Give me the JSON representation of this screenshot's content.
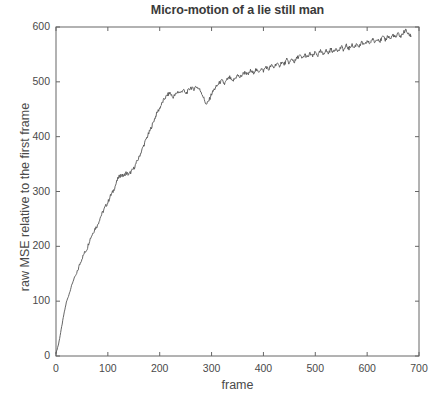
{
  "chart_data": {
    "type": "line",
    "title": "Micro-motion of a lie still man",
    "xlabel": "frame",
    "ylabel": "raw MSE relative to the first frame",
    "xlim": [
      0,
      700
    ],
    "ylim": [
      0,
      600
    ],
    "xticks": [
      0,
      100,
      200,
      300,
      400,
      500,
      600,
      700
    ],
    "yticks": [
      0,
      100,
      200,
      300,
      400,
      500,
      600
    ],
    "grid": false,
    "legend": null,
    "line_color": "#555555",
    "background_color": "#ffffff",
    "axes_color": "#666666",
    "series": [
      {
        "name": "raw MSE",
        "x": [
          0,
          5,
          10,
          15,
          20,
          25,
          30,
          35,
          40,
          45,
          50,
          55,
          60,
          65,
          70,
          75,
          80,
          85,
          90,
          95,
          100,
          105,
          110,
          115,
          120,
          125,
          130,
          135,
          140,
          145,
          150,
          155,
          160,
          165,
          170,
          175,
          180,
          185,
          190,
          195,
          200,
          205,
          210,
          215,
          220,
          225,
          230,
          235,
          240,
          245,
          250,
          255,
          260,
          265,
          270,
          275,
          280,
          285,
          290,
          295,
          300,
          305,
          310,
          315,
          320,
          325,
          330,
          335,
          340,
          345,
          350,
          355,
          360,
          365,
          370,
          375,
          380,
          385,
          390,
          395,
          400,
          405,
          410,
          415,
          420,
          425,
          430,
          435,
          440,
          445,
          450,
          455,
          460,
          465,
          470,
          475,
          480,
          485,
          490,
          495,
          500,
          505,
          510,
          515,
          520,
          525,
          530,
          535,
          540,
          545,
          550,
          555,
          560,
          565,
          570,
          575,
          580,
          585,
          590,
          595,
          600,
          605,
          610,
          615,
          620,
          625,
          630,
          635,
          640,
          645,
          650,
          655,
          660,
          665,
          670,
          675,
          680,
          685
        ],
        "y": [
          5,
          22,
          48,
          75,
          98,
          112,
          128,
          142,
          150,
          165,
          178,
          188,
          196,
          212,
          222,
          232,
          238,
          252,
          262,
          272,
          280,
          292,
          300,
          312,
          325,
          330,
          328,
          334,
          331,
          336,
          342,
          352,
          362,
          374,
          386,
          398,
          408,
          420,
          432,
          444,
          452,
          462,
          470,
          476,
          480,
          472,
          476,
          482,
          480,
          486,
          478,
          484,
          490,
          486,
          492,
          488,
          482,
          470,
          458,
          466,
          478,
          486,
          492,
          498,
          502,
          496,
          504,
          508,
          500,
          506,
          512,
          508,
          514,
          518,
          512,
          520,
          516,
          522,
          518,
          524,
          520,
          528,
          522,
          530,
          526,
          534,
          528,
          536,
          532,
          540,
          534,
          542,
          536,
          544,
          548,
          542,
          550,
          544,
          552,
          546,
          554,
          548,
          556,
          550,
          558,
          552,
          560,
          554,
          562,
          556,
          564,
          558,
          566,
          560,
          568,
          562,
          570,
          564,
          572,
          566,
          574,
          570,
          578,
          572,
          580,
          574,
          582,
          576,
          584,
          578,
          586,
          580,
          588,
          582,
          590,
          594,
          586,
          584
        ]
      }
    ]
  }
}
